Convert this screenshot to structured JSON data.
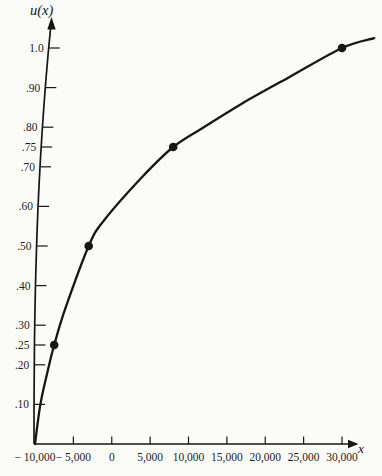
{
  "chart_data": {
    "type": "line",
    "title": "",
    "xlabel": "x",
    "ylabel": "u(x)",
    "xlim": [
      -10000,
      34500
    ],
    "ylim": [
      0,
      1.06
    ],
    "grid": false,
    "legend": "none",
    "colors": {
      "ink": "#161616",
      "background": "#fbfbf8"
    },
    "x_ticks": [
      {
        "value": -10000,
        "label": "− 10,000"
      },
      {
        "value": -5000,
        "label": "− 5,000"
      },
      {
        "value": 0,
        "label": "0"
      },
      {
        "value": 5000,
        "label": "5,000"
      },
      {
        "value": 10000,
        "label": "10,000"
      },
      {
        "value": 15000,
        "label": "15,000"
      },
      {
        "value": 20000,
        "label": "20,000"
      },
      {
        "value": 25000,
        "label": "25,000"
      },
      {
        "value": 30000,
        "label": "30,000"
      }
    ],
    "y_ticks": [
      {
        "value": 1.0,
        "label": "1.0"
      },
      {
        "value": 0.9,
        "label": ".90"
      },
      {
        "value": 0.8,
        "label": ".80"
      },
      {
        "value": 0.75,
        "label": ".75"
      },
      {
        "value": 0.7,
        "label": ".70"
      },
      {
        "value": 0.6,
        "label": ".60"
      },
      {
        "value": 0.5,
        "label": ".50"
      },
      {
        "value": 0.4,
        "label": ".40"
      },
      {
        "value": 0.3,
        "label": ".30"
      },
      {
        "value": 0.25,
        "label": ".25"
      },
      {
        "value": 0.2,
        "label": ".20"
      },
      {
        "value": 0.1,
        "label": ".10"
      }
    ],
    "series": [
      {
        "name": "utility-curve",
        "points": [
          [
            -10000,
            0.0
          ],
          [
            -9300,
            0.1
          ],
          [
            -8400,
            0.18
          ],
          [
            -7500,
            0.25
          ],
          [
            -6000,
            0.345
          ],
          [
            -3000,
            0.5
          ],
          [
            -1000,
            0.565
          ],
          [
            4000,
            0.675
          ],
          [
            8000,
            0.75
          ],
          [
            12000,
            0.8
          ],
          [
            17000,
            0.86
          ],
          [
            23000,
            0.925
          ],
          [
            30000,
            1.0
          ],
          [
            34200,
            1.025
          ]
        ]
      }
    ],
    "marked_points": [
      [
        -7500,
        0.25
      ],
      [
        -3000,
        0.5
      ],
      [
        8000,
        0.75
      ],
      [
        30000,
        1.0
      ]
    ],
    "marker": {
      "shape": "filled-circle",
      "color": "#161616"
    }
  }
}
